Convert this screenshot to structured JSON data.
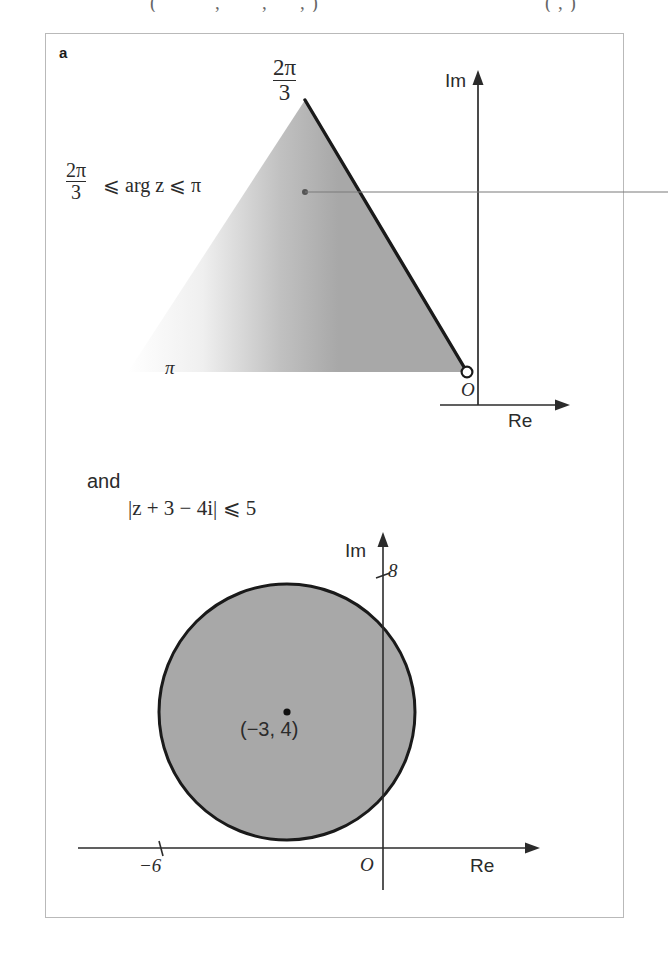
{
  "page": {
    "top_cut_fragment_left": "(",
    "top_cut_fragment_mid1": ",",
    "top_cut_fragment_mid2": ",",
    "top_cut_fragment_mid3": ", )",
    "top_cut_fragment_right": "( , )"
  },
  "figure": {
    "part_label": "a",
    "conjunction": "and"
  },
  "diagram_argand": {
    "name": "argument-region-diagram",
    "apex_label": {
      "numerator": "2π",
      "denominator": "3"
    },
    "condition": {
      "numerator": "2π",
      "denominator": "3",
      "rest": "⩽ arg  z ⩽ π"
    },
    "axis_imaginary": "Im",
    "axis_real": "Re",
    "origin_label": "O",
    "base_angle_label": "π",
    "shaded_fill": "#a8a8a8",
    "outline_color": "#1a1a1a"
  },
  "diagram_circle": {
    "name": "modulus-disc-diagram",
    "condition": "|z + 3 − 4i| ⩽ 5",
    "axis_imaginary": "Im",
    "axis_real": "Re",
    "origin_label": "O",
    "tick_imaginary": "8",
    "tick_real": "−6",
    "centre_label": "(−3, 4)",
    "shaded_fill": "#a8a8a8",
    "outline_color": "#1a1a1a"
  },
  "annotation": {
    "leader_line_name": "callout-leader-line"
  },
  "chart_data": {
    "type": "diagram",
    "panels": [
      {
        "id": "a-top",
        "type": "sector-region",
        "description": "Shaded sector of the Argand plane between arg z = 2pi/3 and arg z = pi",
        "condition": "2π/3 ⩽ arg z ⩽ π",
        "vertex": "O (origin, excluded – open circle)",
        "boundary_angles_rad": [
          2.0944,
          3.14159
        ],
        "boundary_angle_labels": [
          "2π/3",
          "π"
        ],
        "axes": [
          "Re",
          "Im"
        ],
        "shaded": true
      },
      {
        "id": "a-bottom",
        "type": "disc-region",
        "description": "Closed disc centred at (-3, 4) with radius 5",
        "condition": "|z + 3 − 4i| ⩽ 5",
        "centre": [
          -3,
          4
        ],
        "radius": 5,
        "labelled_intercepts": [
          {
            "axis": "Im",
            "value": 8
          },
          {
            "axis": "Re",
            "value": -6
          }
        ],
        "axes": [
          "Re",
          "Im"
        ],
        "shaded": true
      }
    ]
  }
}
